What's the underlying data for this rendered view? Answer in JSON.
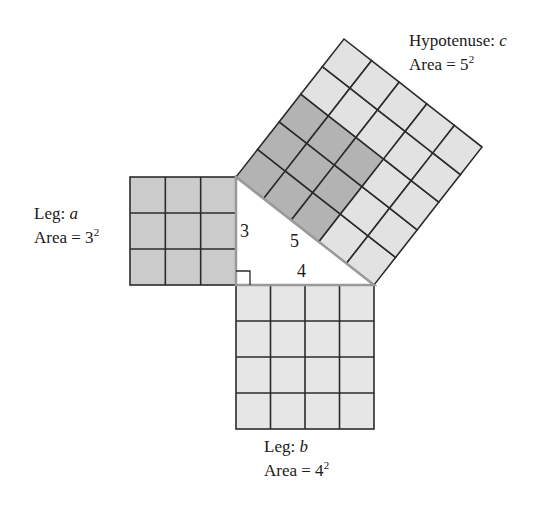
{
  "colors": {
    "grid_line": "#2b2b2b",
    "triangle_edge": "#9a9a9a",
    "leg_a_fill": "#cbcbcb",
    "leg_b_fill": "#e6e6e6",
    "hyp_dark_fill": "#b3b3b3",
    "hyp_light_fill": "#e2e2e2",
    "background": "#ffffff"
  },
  "triangle": {
    "vertices": {
      "top": [
        236,
        177
      ],
      "right_angle": [
        236,
        285
      ],
      "right": [
        374,
        285
      ]
    },
    "side_labels": {
      "a": "3",
      "b": "4",
      "c": "5"
    },
    "right_angle_marker": true
  },
  "squares": {
    "leg_a": {
      "label_line1": "Leg: ",
      "label_var": "a",
      "label_line2": "Area = 3",
      "exponent": "2",
      "grid": 3
    },
    "leg_b": {
      "label_line1": "Leg: ",
      "label_var": "b",
      "label_line2": "Area = 4",
      "exponent": "2",
      "grid": 4
    },
    "hypotenuse": {
      "label_line1": "Hypotenuse: ",
      "label_var": "c",
      "label_line2": "Area = 5",
      "exponent": "2",
      "grid": 5,
      "dark_block": 3
    }
  }
}
